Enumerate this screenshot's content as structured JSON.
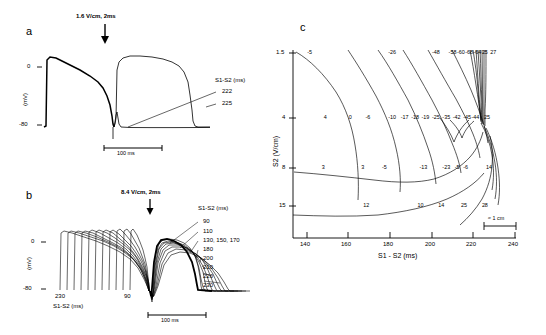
{
  "figure": {
    "panels": [
      "a",
      "b",
      "c"
    ]
  },
  "panel_a": {
    "letter": "a",
    "stimulus_label": "1.6 V/cm, 2ms",
    "y_axis_label": "(mV)",
    "y_ticks": [
      "0",
      "-80"
    ],
    "legend_title": "S1-S2 (ms)",
    "legend_values": [
      "222",
      "225"
    ],
    "scale_bar": "100 ms"
  },
  "panel_b": {
    "letter": "b",
    "stimulus_label": "8.4 V/cm, 2ms",
    "y_axis_label": "(mV)",
    "y_ticks": [
      "0",
      "-80"
    ],
    "legend_title": "S1-S2 (ms)",
    "legend_values": [
      "90",
      "110",
      "130, 150, 170",
      "180",
      "200",
      "210",
      "220",
      "230"
    ],
    "x_axis_label": "S1-S2 (ms)",
    "x_annotations": [
      "230",
      "90"
    ],
    "scale_bar": "100 ms"
  },
  "panel_c": {
    "letter": "c",
    "scale_bar": "≈ 1 cm"
  },
  "chart_data": {
    "type": "scatter",
    "title": "",
    "xlabel": "S1 - S2 (ms)",
    "ylabel": "S2 (V/cm)",
    "xlim": [
      134,
      242
    ],
    "ylim": [
      1.5,
      20
    ],
    "xticks": [
      140,
      160,
      180,
      200,
      220,
      240
    ],
    "yticks": [
      1.5,
      4,
      8,
      15
    ],
    "grid": false,
    "legend": "none",
    "annotations": [
      {
        "x": 142,
        "y": 1.5,
        "value": "-5"
      },
      {
        "x": 181,
        "y": 1.5,
        "value": "-26"
      },
      {
        "x": 202,
        "y": 1.5,
        "value": "-48"
      },
      {
        "x": 210,
        "y": 1.5,
        "value": "-58"
      },
      {
        "x": 214,
        "y": 1.5,
        "value": "-60"
      },
      {
        "x": 218,
        "y": 1.5,
        "value": "-68"
      },
      {
        "x": 222,
        "y": 1.5,
        "value": "-64"
      },
      {
        "x": 226,
        "y": 1.5,
        "value": "25"
      },
      {
        "x": 230,
        "y": 1.5,
        "value": "27"
      },
      {
        "x": 150,
        "y": 4,
        "value": "4"
      },
      {
        "x": 162,
        "y": 4,
        "value": "0"
      },
      {
        "x": 170,
        "y": 4,
        "value": "-6"
      },
      {
        "x": 181,
        "y": 4,
        "value": "-10"
      },
      {
        "x": 187,
        "y": 4,
        "value": "-17"
      },
      {
        "x": 192,
        "y": 4,
        "value": "-18"
      },
      {
        "x": 197,
        "y": 4,
        "value": "-19"
      },
      {
        "x": 202,
        "y": 4,
        "value": "-25"
      },
      {
        "x": 207,
        "y": 4,
        "value": "-35"
      },
      {
        "x": 212,
        "y": 4,
        "value": "-42"
      },
      {
        "x": 217,
        "y": 4,
        "value": "-45"
      },
      {
        "x": 221,
        "y": 4,
        "value": "-44"
      },
      {
        "x": 227,
        "y": 4,
        "value": "25"
      },
      {
        "x": 149,
        "y": 8,
        "value": "3"
      },
      {
        "x": 168,
        "y": 8,
        "value": "3"
      },
      {
        "x": 178,
        "y": 8,
        "value": "-5"
      },
      {
        "x": 196,
        "y": 8,
        "value": "-13"
      },
      {
        "x": 207,
        "y": 8,
        "value": "-23"
      },
      {
        "x": 213,
        "y": 8,
        "value": "-5"
      },
      {
        "x": 217,
        "y": 8,
        "value": "-6"
      },
      {
        "x": 228,
        "y": 8,
        "value": "14"
      },
      {
        "x": 169,
        "y": 15,
        "value": "12"
      },
      {
        "x": 195,
        "y": 15,
        "value": "10"
      },
      {
        "x": 205,
        "y": 15,
        "value": "14"
      },
      {
        "x": 216,
        "y": 15,
        "value": "25"
      },
      {
        "x": 226,
        "y": 15,
        "value": "28"
      }
    ]
  }
}
